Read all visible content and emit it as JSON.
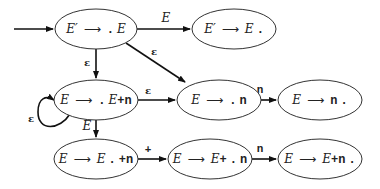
{
  "diagram": {
    "nodes": [
      {
        "id": "n1",
        "lhs": "E′",
        "arrow": "⟶",
        "rhs_pre": "",
        "dot": ".",
        "rhs_post": "E",
        "cx": 96,
        "cy": 29
      },
      {
        "id": "n2",
        "lhs": "E′",
        "arrow": "⟶",
        "rhs_pre": "E",
        "dot": ".",
        "rhs_post": "",
        "cx": 234,
        "cy": 29
      },
      {
        "id": "n3",
        "lhs": "E",
        "arrow": "⟶",
        "rhs_pre": "",
        "dot": ".",
        "rhs_post": "E+n",
        "cx": 96,
        "cy": 100
      },
      {
        "id": "n4",
        "lhs": "E",
        "arrow": "⟶",
        "rhs_pre": "",
        "dot": ".",
        "rhs_post": "n",
        "cx": 219,
        "cy": 100
      },
      {
        "id": "n5",
        "lhs": "E",
        "arrow": "⟶",
        "rhs_pre": "n",
        "dot": ".",
        "rhs_post": "",
        "cx": 320,
        "cy": 100
      },
      {
        "id": "n6",
        "lhs": "E",
        "arrow": "⟶",
        "rhs_pre": "E",
        "dot": ".",
        "rhs_post": "+n",
        "cx": 96,
        "cy": 159
      },
      {
        "id": "n7",
        "lhs": "E",
        "arrow": "⟶",
        "rhs_pre": "E+",
        "dot": ".",
        "rhs_post": "n",
        "cx": 210,
        "cy": 159
      },
      {
        "id": "n8",
        "lhs": "E",
        "arrow": "⟶",
        "rhs_pre": "E+n",
        "dot": ".",
        "rhs_post": "",
        "cx": 320,
        "cy": 159
      }
    ],
    "edges": [
      {
        "from": "start",
        "to": "n1",
        "label": ""
      },
      {
        "from": "n1",
        "to": "n2",
        "label": "E"
      },
      {
        "from": "n1",
        "to": "n3",
        "label": "ε"
      },
      {
        "from": "n1",
        "to": "n4",
        "label": "ε"
      },
      {
        "from": "n3",
        "to": "n3",
        "label": "ε"
      },
      {
        "from": "n3",
        "to": "n4",
        "label": "ε"
      },
      {
        "from": "n4",
        "to": "n5",
        "label": "n"
      },
      {
        "from": "n3",
        "to": "n6",
        "label": "E"
      },
      {
        "from": "n6",
        "to": "n7",
        "label": "+"
      },
      {
        "from": "n7",
        "to": "n8",
        "label": "n"
      }
    ]
  }
}
